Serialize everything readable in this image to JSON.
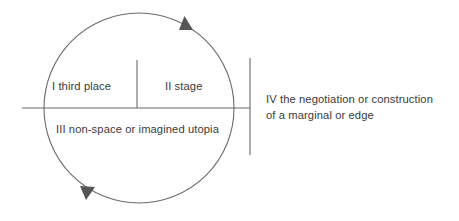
{
  "diagram": {
    "type": "cycle-quadrant-diagram",
    "colors": {
      "stroke": "#6b6b6b",
      "arrow_fill": "#555555",
      "text": "#3a3a3a",
      "background": "#ffffff"
    },
    "geometry": {
      "circle_center_x": 139,
      "circle_center_y": 108,
      "circle_radius": 95,
      "horizontal_axis_y": 108,
      "horizontal_axis_x_start": 22,
      "horizontal_axis_x_end": 250,
      "center_divider_x": 137,
      "center_divider_y_top": 60,
      "center_divider_y_bottom": 108,
      "right_bar_x": 250,
      "right_bar_y_top": 58,
      "right_bar_y_bottom": 155
    },
    "quadrants": [
      {
        "numeral": "I",
        "label": "I third place",
        "position": "upper-left"
      },
      {
        "numeral": "II",
        "label": "II stage",
        "position": "upper-right"
      },
      {
        "numeral": "III",
        "label": "III non-space or imagined utopia",
        "position": "lower"
      },
      {
        "numeral": "IV",
        "label_line_1": "IV the negotiation or construction",
        "label_line_2": "of a marginal or edge",
        "position": "outside-right"
      }
    ],
    "arrows": [
      {
        "name": "top-arrowhead",
        "direction": "clockwise-top",
        "points_toward": "right"
      },
      {
        "name": "bottom-arrowhead",
        "direction": "clockwise-bottom",
        "points_toward": "down-left"
      }
    ]
  }
}
